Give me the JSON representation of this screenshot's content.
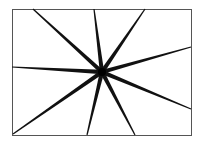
{
  "diagram": {
    "frame": {
      "x": 12,
      "y": 9,
      "width": 179,
      "height": 126,
      "stroke": "#555555",
      "stroke_width": 1
    },
    "center": {
      "x": 102,
      "y": 72
    },
    "line_color": "#111111",
    "rays": [
      {
        "x": 33,
        "y": 9
      },
      {
        "x": 94,
        "y": 9
      },
      {
        "x": 145,
        "y": 9
      },
      {
        "x": 191,
        "y": 47
      },
      {
        "x": 191,
        "y": 109
      },
      {
        "x": 135,
        "y": 135
      },
      {
        "x": 87,
        "y": 135
      },
      {
        "x": 13,
        "y": 134
      },
      {
        "x": 12,
        "y": 67
      }
    ]
  }
}
